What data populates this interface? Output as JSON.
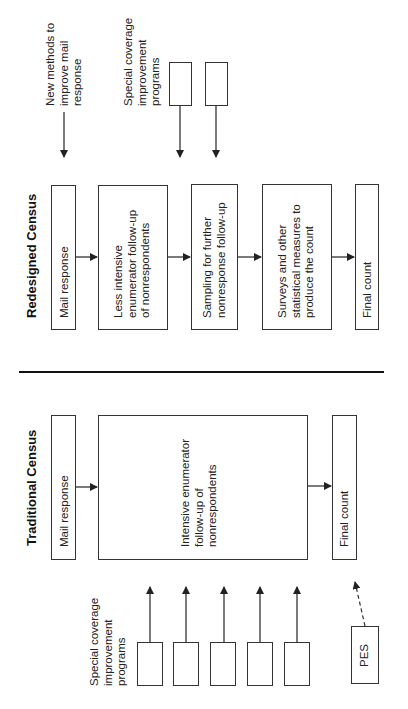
{
  "redesigned": {
    "title": "Redesigned Census",
    "steps": [
      {
        "label_lines": [
          "Mail response"
        ]
      },
      {
        "label_lines": [
          "Less intensive",
          "enumerator follow-up",
          "of nonrespondents"
        ]
      },
      {
        "label_lines": [
          "Sampling for further",
          "nonresponse follow-up"
        ]
      },
      {
        "label_lines": [
          "Surveys and other",
          "statistical measures to",
          "produce the count"
        ]
      },
      {
        "label_lines": [
          "Final count"
        ]
      }
    ],
    "inputs": {
      "new_methods_lines": [
        "New methods to",
        "improve mail",
        "response"
      ],
      "special_coverage_lines": [
        "Special coverage",
        "improvement",
        "programs"
      ],
      "special_coverage_box_count": 2
    }
  },
  "traditional": {
    "title": "Traditional Census",
    "steps": [
      {
        "label_lines": [
          "Mail response"
        ]
      },
      {
        "label_lines": [
          "Intensive enumerator",
          "follow-up of",
          "nonrespondents"
        ]
      },
      {
        "label_lines": [
          "Final count"
        ]
      }
    ],
    "inputs": {
      "special_coverage_lines": [
        "Special coverage",
        "improvement",
        "programs"
      ],
      "special_coverage_box_count": 5,
      "pes_label": "PES"
    }
  },
  "colors": {
    "line": "#333333",
    "text": "#222222",
    "background": "#ffffff"
  }
}
